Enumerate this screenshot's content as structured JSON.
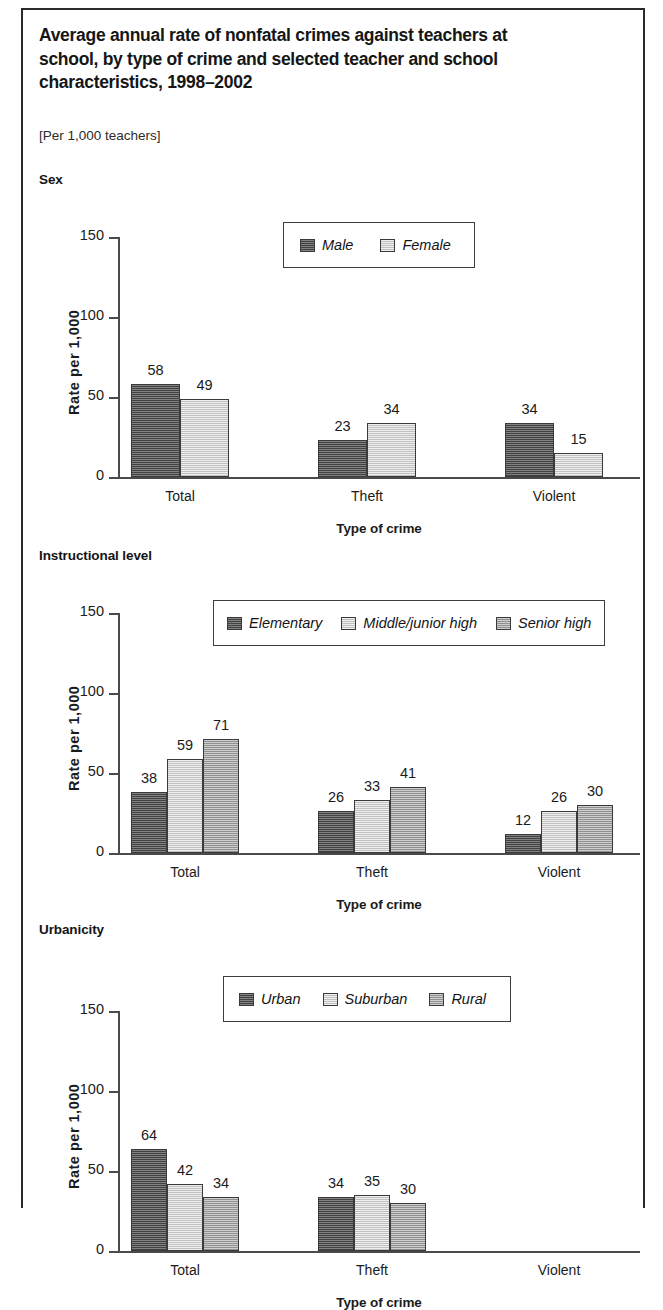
{
  "figure": {
    "title_lines": [
      "Average annual rate of nonfatal crimes against teachers at",
      "school, by type of crime and selected teacher and school",
      "characteristics, 1998–2002"
    ],
    "units_note": "[Per 1,000 teachers]",
    "axis": {
      "ylabel": "Rate per 1,000",
      "xlabel": "Type of crime",
      "yticks": [
        "150",
        "100",
        "50",
        "0"
      ],
      "ylim": [
        0,
        150
      ],
      "categories": [
        "Total",
        "Theft",
        "Violent"
      ]
    },
    "colors": {
      "series_dark": "#5e5e5e",
      "series_light": "#dcdcdc",
      "series_mid": "#b4b4b4",
      "frame": "#2a2a2a",
      "axis": "#4a4a4a",
      "text": "#1b1b1b"
    }
  },
  "chart_data": [
    {
      "type": "bar",
      "panel_label": "Sex",
      "title": "Average annual rate of nonfatal crimes against teachers at school, by type of crime and selected teacher and school characteristics, 1998–2002",
      "xlabel": "Type of crime",
      "ylabel": "Rate per 1,000",
      "ylim": [
        0,
        150
      ],
      "yticks": [
        0,
        50,
        100,
        150
      ],
      "grid": false,
      "legend_position": "top-center",
      "categories": [
        "Total",
        "Theft",
        "Violent"
      ],
      "series": [
        {
          "name": "Male",
          "shade": "dark",
          "values": [
            58,
            23,
            34
          ]
        },
        {
          "name": "Female",
          "shade": "light",
          "values": [
            49,
            34,
            15
          ]
        }
      ]
    },
    {
      "type": "bar",
      "panel_label": "Instructional level",
      "xlabel": "Type of crime",
      "ylabel": "Rate per 1,000",
      "ylim": [
        0,
        150
      ],
      "yticks": [
        0,
        50,
        100,
        150
      ],
      "grid": false,
      "legend_position": "top-center",
      "categories": [
        "Total",
        "Theft",
        "Violent"
      ],
      "series": [
        {
          "name": "Elementary",
          "shade": "dark",
          "values": [
            38,
            26,
            12
          ]
        },
        {
          "name": "Middle/junior high",
          "shade": "light",
          "values": [
            59,
            33,
            26
          ]
        },
        {
          "name": "Senior high",
          "shade": "mid",
          "values": [
            71,
            41,
            30
          ]
        }
      ]
    },
    {
      "type": "bar",
      "panel_label": "Urbanicity",
      "xlabel": "Type of crime",
      "ylabel": "Rate per 1,000",
      "ylim": [
        0,
        150
      ],
      "yticks": [
        0,
        50,
        100,
        150
      ],
      "grid": false,
      "legend_position": "top-center",
      "clipped_at_bottom_of_page": true,
      "categories": [
        "Total",
        "Theft",
        "Violent"
      ],
      "series": [
        {
          "name": "Urban",
          "shade": "dark",
          "values": [
            64,
            34,
            30
          ]
        },
        {
          "name": "Suburban",
          "shade": "light",
          "values": [
            42,
            35,
            0
          ]
        },
        {
          "name": "Rural",
          "shade": "mid",
          "values": [
            34,
            0,
            0
          ]
        }
      ],
      "visible_value_labels": [
        "64",
        "42",
        "34",
        "35"
      ]
    }
  ],
  "panels": [
    {
      "label": "Sex",
      "yticks": [
        "150",
        "100",
        "50",
        "0"
      ],
      "ylabel": "Rate per 1,000",
      "xlabel": "Type of crime",
      "categories": [
        "Total",
        "Theft",
        "Violent"
      ],
      "legend": [
        {
          "label": "Male",
          "shade": "dark"
        },
        {
          "label": "Female",
          "shade": "light"
        }
      ],
      "bars": [
        {
          "value": 58,
          "label": "58",
          "shade": "dark"
        },
        {
          "value": 49,
          "label": "49",
          "shade": "light"
        },
        {
          "value": 23,
          "label": "23",
          "shade": "dark"
        },
        {
          "value": 34,
          "label": "34",
          "shade": "light"
        },
        {
          "value": 34,
          "label": "34",
          "shade": "dark"
        },
        {
          "value": 15,
          "label": "15",
          "shade": "light"
        }
      ]
    },
    {
      "label": "Instructional level",
      "yticks": [
        "150",
        "100",
        "50",
        "0"
      ],
      "ylabel": "Rate per 1,000",
      "xlabel": "Type of crime",
      "categories": [
        "Total",
        "Theft",
        "Violent"
      ],
      "legend": [
        {
          "label": "Elementary",
          "shade": "dark"
        },
        {
          "label": "Middle/junior high",
          "shade": "light"
        },
        {
          "label": "Senior high",
          "shade": "mid"
        }
      ],
      "bars": [
        {
          "value": 38,
          "label": "38",
          "shade": "dark"
        },
        {
          "value": 59,
          "label": "59",
          "shade": "light"
        },
        {
          "value": 71,
          "label": "71",
          "shade": "mid"
        },
        {
          "value": 26,
          "label": "26",
          "shade": "dark"
        },
        {
          "value": 33,
          "label": "33",
          "shade": "light"
        },
        {
          "value": 41,
          "label": "41",
          "shade": "mid"
        },
        {
          "value": 12,
          "label": "12",
          "shade": "dark"
        },
        {
          "value": 26,
          "label": "26",
          "shade": "light"
        },
        {
          "value": 30,
          "label": "30",
          "shade": "mid"
        }
      ]
    },
    {
      "label": "Urbanicity",
      "yticks": [
        "150",
        "100",
        "50",
        "0"
      ],
      "ylabel": "Rate per 1,000",
      "xlabel": "Type of crime",
      "categories": [
        "Total",
        "Theft",
        "Violent"
      ],
      "legend": [
        {
          "label": "Urban",
          "shade": "dark"
        },
        {
          "label": "Suburban",
          "shade": "light"
        },
        {
          "label": "Rural",
          "shade": "mid"
        }
      ],
      "bars": [
        {
          "value": 64,
          "label": "64",
          "shade": "dark"
        },
        {
          "value": 42,
          "label": "42",
          "shade": "light"
        },
        {
          "value": 34,
          "label": "34",
          "shade": "mid"
        },
        {
          "value": 34,
          "label": "34",
          "shade": "dark"
        },
        {
          "value": 35,
          "label": "35",
          "shade": "light"
        },
        {
          "value": 30,
          "label": "30",
          "shade": "mid"
        }
      ]
    }
  ]
}
